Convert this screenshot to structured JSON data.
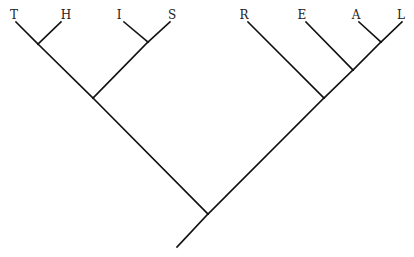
{
  "diagram": {
    "type": "cladogram",
    "leaves": [
      "T",
      "H",
      "I",
      "S",
      "R",
      "E",
      "A",
      "L"
    ],
    "topology": "((((T,H),(I,S)),(R,(E,(A,L)))))",
    "clades": [
      {
        "id": "th",
        "members": [
          "T",
          "H"
        ]
      },
      {
        "id": "is",
        "members": [
          "I",
          "S"
        ]
      },
      {
        "id": "this",
        "members": [
          "T",
          "H",
          "I",
          "S"
        ]
      },
      {
        "id": "al",
        "members": [
          "A",
          "L"
        ]
      },
      {
        "id": "eal",
        "members": [
          "E",
          "A",
          "L"
        ]
      },
      {
        "id": "real",
        "members": [
          "R",
          "E",
          "A",
          "L"
        ]
      },
      {
        "id": "root",
        "members": [
          "T",
          "H",
          "I",
          "S",
          "R",
          "E",
          "A",
          "L"
        ]
      }
    ],
    "line_color": "#111111",
    "label_color": "#222222"
  }
}
